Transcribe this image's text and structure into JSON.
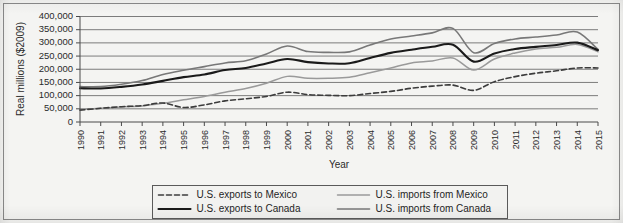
{
  "chart_data": {
    "type": "line",
    "title": "",
    "xlabel": "Year",
    "ylabel": "Real millions ($2009)",
    "grid": true,
    "legend_position": "bottom",
    "ylim": [
      0,
      400000
    ],
    "ytick_step": 50000,
    "ytick_labels": [
      "0",
      "50,000",
      "100,000",
      "150,000",
      "200,000",
      "250,000",
      "300,000",
      "350,000",
      "400,000"
    ],
    "ytick_values": [
      0,
      50000,
      100000,
      150000,
      200000,
      250000,
      300000,
      350000,
      400000
    ],
    "categories": [
      "1990",
      "1991",
      "1992",
      "1993",
      "1994",
      "1995",
      "1996",
      "1997",
      "1998",
      "1999",
      "2000",
      "2001",
      "2002",
      "2003",
      "2004",
      "2005",
      "2006",
      "2007",
      "2008",
      "2009",
      "2010",
      "2011",
      "2012",
      "2013",
      "2014",
      "2015"
    ],
    "series": [
      {
        "name": "U.S. exports to Mexico",
        "key": "exports-mexico",
        "color": "#3c3c3c",
        "width": 1.6,
        "dash": "5,3",
        "values": [
          45000,
          52000,
          58000,
          62000,
          72000,
          55000,
          65000,
          80000,
          88000,
          97000,
          113000,
          104000,
          101000,
          100000,
          108000,
          116000,
          128000,
          136000,
          140000,
          120000,
          153000,
          172000,
          185000,
          194000,
          205000,
          205000
        ]
      },
      {
        "name": "U.S. exports to Canada",
        "key": "exports-canada",
        "color": "#1a1a1a",
        "width": 2.1,
        "dash": "none",
        "values": [
          128000,
          127000,
          133000,
          142000,
          156000,
          170000,
          180000,
          197000,
          205000,
          222000,
          239000,
          227000,
          222000,
          223000,
          243000,
          262000,
          274000,
          285000,
          293000,
          229000,
          260000,
          277000,
          285000,
          292000,
          301000,
          272000
        ]
      },
      {
        "name": "U.S. imports from Mexico",
        "key": "imports-mexico",
        "color": "#9a9a9a",
        "width": 1.5,
        "dash": "none",
        "values": [
          48000,
          52000,
          57000,
          61000,
          71000,
          84000,
          97000,
          113000,
          127000,
          147000,
          173000,
          166000,
          166000,
          170000,
          187000,
          205000,
          224000,
          231000,
          243000,
          197000,
          239000,
          262000,
          277000,
          283000,
          294000,
          266000
        ]
      },
      {
        "name": "U.S. imports from Canada",
        "key": "imports-canada",
        "color": "#787878",
        "width": 1.6,
        "dash": "none",
        "values": [
          134000,
          134000,
          143000,
          157000,
          180000,
          196000,
          210000,
          224000,
          232000,
          258000,
          288000,
          267000,
          264000,
          266000,
          292000,
          315000,
          326000,
          338000,
          355000,
          263000,
          298000,
          315000,
          322000,
          330000,
          341000,
          275000
        ]
      }
    ]
  },
  "legend": {
    "entries": [
      {
        "label": "U.S. exports to Mexico",
        "series_key": "exports-mexico"
      },
      {
        "label": "U.S. imports from Mexico",
        "series_key": "imports-mexico"
      },
      {
        "label": "U.S. exports to Canada",
        "series_key": "exports-canada"
      },
      {
        "label": "U.S. imports from Canada",
        "series_key": "imports-canada"
      }
    ]
  },
  "colors": {
    "background": "#f2f2f0",
    "plot_background": "#f4f4f2",
    "gridline": "#6e6e6e",
    "axis": "#4a4a4a",
    "text": "#2b2b2b"
  }
}
